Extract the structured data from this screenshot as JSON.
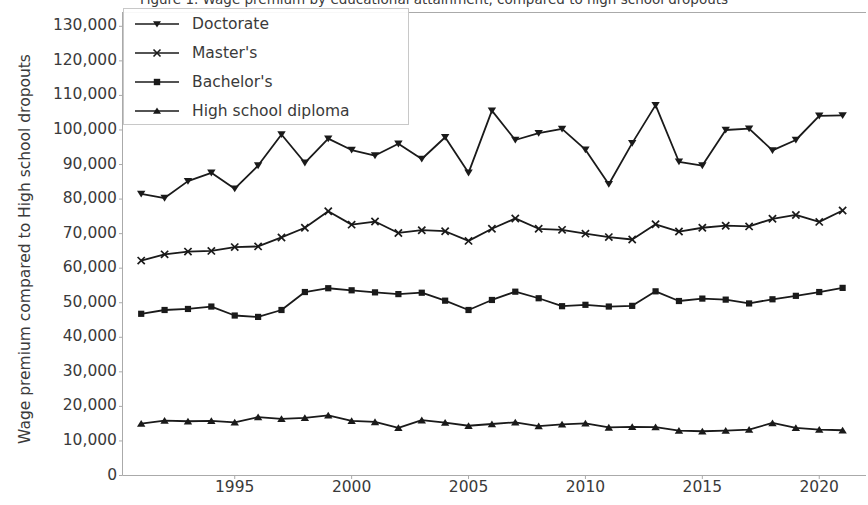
{
  "chart_data": {
    "type": "line",
    "title": "Figure 1. Wage premium by educational attainment, compared to high school dropouts",
    "xlabel": "",
    "ylabel": "Wage premium compared to High school dropouts",
    "x": [
      1991,
      1992,
      1993,
      1994,
      1995,
      1996,
      1997,
      1998,
      1999,
      2000,
      2001,
      2002,
      2003,
      2004,
      2005,
      2006,
      2007,
      2008,
      2009,
      2010,
      2011,
      2012,
      2013,
      2014,
      2015,
      2016,
      2017,
      2018,
      2019,
      2020,
      2021
    ],
    "xlim": [
      1990.2,
      2022.0
    ],
    "ylim": [
      0,
      134000
    ],
    "xticks": [
      1995,
      2000,
      2005,
      2010,
      2015,
      2020
    ],
    "yticks": [
      0,
      10000,
      20000,
      30000,
      40000,
      50000,
      60000,
      70000,
      80000,
      90000,
      100000,
      110000,
      120000,
      130000
    ],
    "ytick_labels": [
      "0",
      "10,000",
      "20,000",
      "30,000",
      "40,000",
      "50,000",
      "60,000",
      "70,000",
      "80,000",
      "90,000",
      "100,000",
      "110,000",
      "120,000",
      "130,000"
    ],
    "xtick_labels": [
      "1995",
      "2000",
      "2005",
      "2010",
      "2015",
      "2020"
    ],
    "grid": false,
    "legend_position": "upper left",
    "line_color": "#1a1a1a",
    "series": [
      {
        "name": "Doctorate",
        "marker": "triangle-down",
        "values": [
          81500,
          80300,
          85200,
          87600,
          83000,
          89700,
          98700,
          90500,
          97500,
          94200,
          92600,
          96000,
          91600,
          97900,
          87600,
          105600,
          97100,
          99100,
          100300,
          94300,
          84300,
          96200,
          107200,
          90800,
          89700,
          100000,
          100400,
          94100,
          97100,
          104100,
          104200
        ]
      },
      {
        "name": "Master's",
        "marker": "x",
        "values": [
          62200,
          64000,
          64800,
          65000,
          66100,
          66300,
          68900,
          71700,
          76500,
          72600,
          73500,
          70200,
          71000,
          70700,
          67900,
          71400,
          74400,
          71400,
          71100,
          70000,
          69000,
          68300,
          72700,
          70600,
          71700,
          72300,
          72100,
          74300,
          75400,
          73400,
          76700
        ]
      },
      {
        "name": "Bachelor's",
        "marker": "square",
        "values": [
          46800,
          47900,
          48200,
          48900,
          46300,
          45900,
          47900,
          53100,
          54200,
          53600,
          53000,
          52500,
          52900,
          50600,
          47900,
          50800,
          53200,
          51300,
          49000,
          49400,
          48900,
          49100,
          53300,
          50500,
          51200,
          50900,
          49800,
          51000,
          52000,
          53100,
          54300
        ]
      },
      {
        "name": "High school diploma",
        "marker": "triangle-up",
        "values": [
          15000,
          15900,
          15700,
          15800,
          15400,
          16900,
          16400,
          16700,
          17400,
          15800,
          15500,
          13800,
          16000,
          15300,
          14400,
          14900,
          15400,
          14300,
          14800,
          15100,
          13900,
          14100,
          14000,
          13000,
          12800,
          13000,
          13300,
          15200,
          13800,
          13300,
          13100
        ]
      }
    ]
  },
  "legend": {
    "items": [
      {
        "label": "Doctorate"
      },
      {
        "label": "Master's"
      },
      {
        "label": "Bachelor's"
      },
      {
        "label": "High school diploma"
      }
    ]
  }
}
